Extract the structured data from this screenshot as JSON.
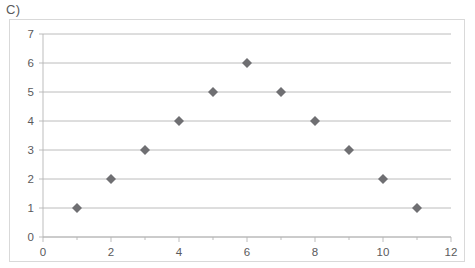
{
  "panel": {
    "label": "C)"
  },
  "chart_data": {
    "type": "scatter",
    "title": "",
    "subtitle": "",
    "xlabel": "",
    "ylabel": "",
    "x": [
      1,
      2,
      3,
      4,
      5,
      6,
      7,
      8,
      9,
      10,
      11
    ],
    "values": [
      1,
      2,
      3,
      4,
      5,
      6,
      5,
      4,
      3,
      2,
      1
    ],
    "points": [
      {
        "x": 1,
        "y": 1
      },
      {
        "x": 2,
        "y": 2
      },
      {
        "x": 3,
        "y": 3
      },
      {
        "x": 4,
        "y": 4
      },
      {
        "x": 5,
        "y": 5
      },
      {
        "x": 6,
        "y": 6
      },
      {
        "x": 7,
        "y": 5
      },
      {
        "x": 8,
        "y": 4
      },
      {
        "x": 9,
        "y": 3
      },
      {
        "x": 10,
        "y": 2
      },
      {
        "x": 11,
        "y": 1
      }
    ],
    "xlim": [
      0,
      12
    ],
    "ylim": [
      0,
      7
    ],
    "x_tick_labels": [
      "0",
      "2",
      "4",
      "6",
      "8",
      "10",
      "12"
    ],
    "x_tick_values": [
      0,
      2,
      4,
      6,
      8,
      10,
      12
    ],
    "x_minor_tick_values": [
      1,
      3,
      5,
      7,
      9,
      11
    ],
    "y_tick_labels": [
      "0",
      "1",
      "2",
      "3",
      "4",
      "5",
      "6",
      "7"
    ],
    "y_tick_values": [
      0,
      1,
      2,
      3,
      4,
      5,
      6,
      7
    ],
    "grid": "horizontal",
    "legend": "none",
    "marker": "diamond",
    "marker_color": "#6f6f72",
    "gridline_color": "#a6a6a6",
    "axis_color": "#b6b6b6",
    "border_color": "#d9d9d9",
    "background_color": "#ffffff",
    "annotations": []
  }
}
